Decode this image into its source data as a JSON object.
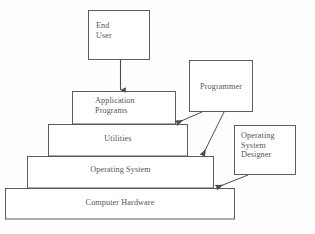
{
  "diagram": {
    "type": "layered-architecture-diagram",
    "background_color": "#fefefe",
    "stroke_color": "#4d4d4d",
    "text_color": "#555555",
    "layers": [
      {
        "id": "application-programs",
        "label": "Application\nPrograms",
        "level": 1,
        "x": 72,
        "y": 91,
        "width": 104,
        "height": 33
      },
      {
        "id": "utilities",
        "label": "Utilities",
        "level": 2,
        "x": 48,
        "y": 124,
        "width": 140,
        "height": 32
      },
      {
        "id": "operating-system",
        "label": "Operating System",
        "level": 3,
        "x": 27,
        "y": 156,
        "width": 187,
        "height": 32
      },
      {
        "id": "computer-hardware",
        "label": "Computer Hardware",
        "level": 4,
        "x": 5,
        "y": 188,
        "width": 230,
        "height": 31
      }
    ],
    "actors": [
      {
        "id": "end-user",
        "label": "End\nUser",
        "x": 88,
        "y": 10,
        "width": 62,
        "height": 50
      },
      {
        "id": "programmer",
        "label": "Programmer",
        "x": 189,
        "y": 60,
        "width": 64,
        "height": 52
      },
      {
        "id": "operating-system-designer",
        "label": "Operating\nSystem\nDesigner",
        "x": 234,
        "y": 125,
        "width": 62,
        "height": 50
      }
    ],
    "arrows": [
      {
        "id": "end-user-to-application-programs",
        "from": "end-user",
        "to": "application-programs",
        "style": "straight-vertical"
      },
      {
        "id": "programmer-to-application-programs",
        "from": "programmer",
        "to": "application-programs",
        "style": "straight-diagonal"
      },
      {
        "id": "programmer-to-utilities",
        "from": "programmer",
        "to": "utilities",
        "style": "straight-diagonal"
      },
      {
        "id": "os-designer-to-operating-system",
        "from": "operating-system-designer",
        "to": "operating-system",
        "style": "straight-diagonal"
      }
    ]
  }
}
